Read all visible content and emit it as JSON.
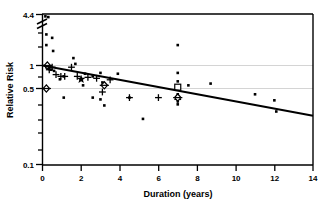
{
  "chart_data": {
    "type": "scatter",
    "title": "",
    "xlabel": "Duration (years)",
    "ylabel": "Relative Risk",
    "xlim": [
      0,
      14
    ],
    "ylim_log": [
      0.1,
      4.4
    ],
    "yscale": "log",
    "axis_break": true,
    "axis_break_label": "4.4",
    "grid": "horizontal-faint",
    "legend_position": "none",
    "xticks": [
      0,
      2,
      4,
      6,
      8,
      10,
      12,
      14
    ],
    "xtick_labels": [
      "0",
      "2",
      "4",
      "6",
      "8",
      "10",
      "12",
      "14"
    ],
    "yticks": [
      0.1,
      0.5,
      1,
      4.4
    ],
    "ytick_labels": [
      "0.1",
      "0.5",
      "1",
      "4.4"
    ],
    "gridlines_y": [
      0.5,
      1
    ],
    "regression_line": {
      "x_start": 0,
      "y_start": 1.0,
      "x_end": 14,
      "y_end": 0.22,
      "style": "solid",
      "width": 2
    },
    "series": [
      {
        "name": "dot",
        "marker": "filled-circle",
        "points": [
          [
            0.15,
            4.4
          ],
          [
            0.2,
            2.55
          ],
          [
            0.2,
            1.85
          ],
          [
            0.3,
            4.3
          ],
          [
            0.5,
            2.3
          ],
          [
            0.55,
            1.55
          ],
          [
            0.2,
            0.95
          ],
          [
            0.35,
            0.9
          ],
          [
            0.45,
            0.88
          ],
          [
            0.6,
            0.85
          ],
          [
            0.9,
            0.66
          ],
          [
            1.6,
            1.25
          ],
          [
            1.7,
            1.05
          ],
          [
            1.1,
            0.72
          ],
          [
            2.2,
            0.78
          ],
          [
            2.1,
            0.55
          ],
          [
            2.6,
            0.72
          ],
          [
            3.0,
            0.8
          ],
          [
            3.1,
            0.6
          ],
          [
            3.9,
            0.78
          ],
          [
            1.1,
            0.38
          ],
          [
            2.6,
            0.38
          ],
          [
            3.0,
            0.36
          ],
          [
            3.2,
            0.3
          ],
          [
            4.5,
            0.38
          ],
          [
            5.2,
            0.2
          ],
          [
            7.0,
            1.85
          ],
          [
            7.0,
            0.8
          ],
          [
            7.0,
            0.62
          ],
          [
            7.0,
            0.54
          ],
          [
            7.0,
            0.42
          ],
          [
            7.0,
            0.34
          ],
          [
            7.0,
            0.31
          ],
          [
            7.55,
            0.55
          ],
          [
            8.7,
            0.58
          ],
          [
            11.0,
            0.42
          ],
          [
            12.0,
            0.35
          ],
          [
            12.1,
            0.25
          ]
        ]
      },
      {
        "name": "plus",
        "marker": "plus",
        "points": [
          [
            0.35,
            0.88
          ],
          [
            0.5,
            0.95
          ],
          [
            0.7,
            0.76
          ],
          [
            0.95,
            0.72
          ],
          [
            1.15,
            0.72
          ],
          [
            1.5,
            0.95
          ],
          [
            1.8,
            0.72
          ],
          [
            2.35,
            0.7
          ],
          [
            2.8,
            0.68
          ],
          [
            3.1,
            0.45
          ],
          [
            3.5,
            0.65
          ],
          [
            4.5,
            0.38
          ],
          [
            6.0,
            0.38
          ],
          [
            7.0,
            0.36
          ]
        ]
      },
      {
        "name": "star",
        "marker": "filled-star",
        "points": [
          [
            2.0,
            0.66
          ]
        ]
      },
      {
        "name": "open-diamond",
        "marker": "open-diamond",
        "points": [
          [
            0.25,
            1.0
          ],
          [
            0.2,
            0.5
          ],
          [
            3.2,
            0.55
          ],
          [
            7.0,
            0.38
          ]
        ]
      },
      {
        "name": "open-square",
        "marker": "open-square",
        "points": [
          [
            7.0,
            0.52
          ]
        ]
      }
    ]
  },
  "axes": {
    "ylabel": "Relative Risk",
    "xlabel": "Duration (years)",
    "ytick_top": "4.4",
    "ytick_one": "1",
    "ytick_half": "0.5",
    "ytick_bottom": "0.1",
    "xtick_0": "0",
    "xtick_2": "2",
    "xtick_4": "4",
    "xtick_6": "6",
    "xtick_8": "8",
    "xtick_10": "10",
    "xtick_12": "12",
    "xtick_14": "14"
  },
  "colors": {
    "axis": "#000000",
    "marker": "#000000",
    "line": "#000000",
    "grid": "#c8c8c8",
    "background": "#ffffff"
  }
}
